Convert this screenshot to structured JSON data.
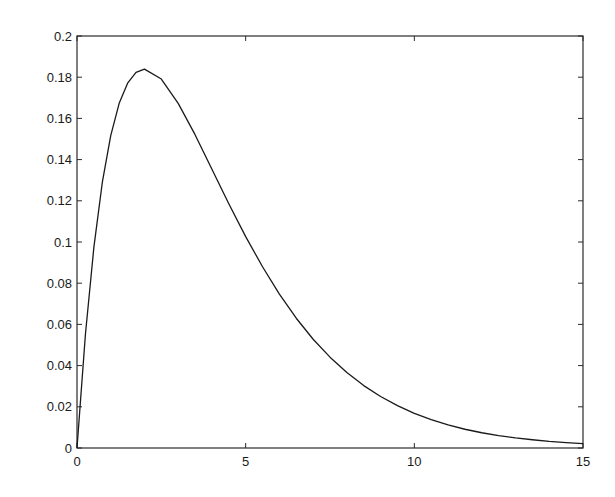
{
  "chart_data": {
    "type": "line",
    "title": "",
    "xlabel": "",
    "ylabel": "",
    "xlim": [
      0,
      15
    ],
    "ylim": [
      0,
      0.2
    ],
    "grid": false,
    "legend": null,
    "x_ticks": [
      0,
      5,
      10,
      15
    ],
    "x_tick_labels": [
      "0",
      "5",
      "10",
      "15"
    ],
    "y_ticks": [
      0,
      0.02,
      0.04,
      0.06,
      0.08,
      0.1,
      0.12,
      0.14,
      0.16,
      0.18,
      0.2
    ],
    "y_tick_labels": [
      "0",
      "0.02",
      "0.04",
      "0.06",
      "0.08",
      "0.1",
      "0.12",
      "0.14",
      "0.16",
      "0.18",
      "0.2"
    ],
    "series": [
      {
        "name": "curve",
        "color": "#1a1a1a",
        "x": [
          0,
          0.25,
          0.5,
          0.75,
          1,
          1.25,
          1.5,
          1.75,
          2,
          2.5,
          3,
          3.5,
          4,
          4.5,
          5,
          5.5,
          6,
          6.5,
          7,
          7.5,
          8,
          8.5,
          9,
          9.5,
          10,
          10.5,
          11,
          11.5,
          12,
          12.5,
          13,
          13.5,
          14,
          14.5,
          15
        ],
        "y": [
          0,
          0.0552,
          0.0974,
          0.1289,
          0.1516,
          0.1673,
          0.1771,
          0.1823,
          0.1839,
          0.1791,
          0.1673,
          0.1521,
          0.1353,
          0.1186,
          0.1026,
          0.088,
          0.0747,
          0.063,
          0.0528,
          0.0441,
          0.0366,
          0.0303,
          0.025,
          0.0206,
          0.0168,
          0.0138,
          0.0112,
          0.0091,
          0.0074,
          0.006,
          0.0049,
          0.004,
          0.0032,
          0.0026,
          0.0021
        ]
      }
    ]
  }
}
